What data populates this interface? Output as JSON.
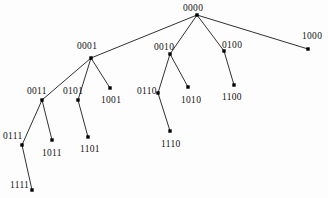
{
  "figure": {
    "type": "node-link-tree",
    "background_color": "#fdfdfd",
    "edge_color": "#1a1a1a",
    "node_color": "#000000",
    "label_color": "#111111",
    "width": 328,
    "height": 198
  },
  "chart_data": {
    "type": "diagram",
    "title": "",
    "nodes": [
      {
        "id": "0000",
        "label": "0000",
        "x": 197,
        "y": 15,
        "label_x": 183,
        "label_y": 3
      },
      {
        "id": "0001",
        "label": "0001",
        "x": 91,
        "y": 58,
        "label_x": 77,
        "label_y": 41
      },
      {
        "id": "0010",
        "label": "0010",
        "x": 170,
        "y": 54,
        "label_x": 154,
        "label_y": 42
      },
      {
        "id": "0100",
        "label": "0100",
        "x": 224,
        "y": 51,
        "label_x": 222,
        "label_y": 40
      },
      {
        "id": "1000",
        "label": "1000",
        "x": 308,
        "y": 49,
        "label_x": 302,
        "label_y": 31
      },
      {
        "id": "0011",
        "label": "0011",
        "x": 42,
        "y": 100,
        "label_x": 27,
        "label_y": 86
      },
      {
        "id": "0101",
        "label": "0101",
        "x": 78,
        "y": 100,
        "label_x": 63,
        "label_y": 86
      },
      {
        "id": "1001",
        "label": "1001",
        "x": 110,
        "y": 88,
        "label_x": 101,
        "label_y": 95
      },
      {
        "id": "0110",
        "label": "0110",
        "x": 158,
        "y": 93,
        "label_x": 137,
        "label_y": 86
      },
      {
        "id": "1010",
        "label": "1010",
        "x": 188,
        "y": 87,
        "label_x": 181,
        "label_y": 95
      },
      {
        "id": "1100",
        "label": "1100",
        "x": 234,
        "y": 85,
        "label_x": 222,
        "label_y": 92
      },
      {
        "id": "0111",
        "label": "0111",
        "x": 22,
        "y": 145,
        "label_x": 3,
        "label_y": 131
      },
      {
        "id": "1011",
        "label": "1011",
        "x": 52,
        "y": 140,
        "label_x": 42,
        "label_y": 148
      },
      {
        "id": "1101",
        "label": "1101",
        "x": 88,
        "y": 137,
        "label_x": 80,
        "label_y": 144
      },
      {
        "id": "1110",
        "label": "1110",
        "x": 170,
        "y": 131,
        "label_x": 161,
        "label_y": 139
      },
      {
        "id": "1111",
        "label": "1111",
        "x": 32,
        "y": 190,
        "label_x": 10,
        "label_y": 180
      }
    ],
    "edges": [
      {
        "from": "0000",
        "to": "0001"
      },
      {
        "from": "0000",
        "to": "0010"
      },
      {
        "from": "0000",
        "to": "0100"
      },
      {
        "from": "0000",
        "to": "1000"
      },
      {
        "from": "0001",
        "to": "0011"
      },
      {
        "from": "0001",
        "to": "0101"
      },
      {
        "from": "0001",
        "to": "1001"
      },
      {
        "from": "0010",
        "to": "0110"
      },
      {
        "from": "0010",
        "to": "1010"
      },
      {
        "from": "0100",
        "to": "1100"
      },
      {
        "from": "0011",
        "to": "0111"
      },
      {
        "from": "0011",
        "to": "1011"
      },
      {
        "from": "0101",
        "to": "1101"
      },
      {
        "from": "0110",
        "to": "1110"
      },
      {
        "from": "0111",
        "to": "1111"
      }
    ]
  }
}
